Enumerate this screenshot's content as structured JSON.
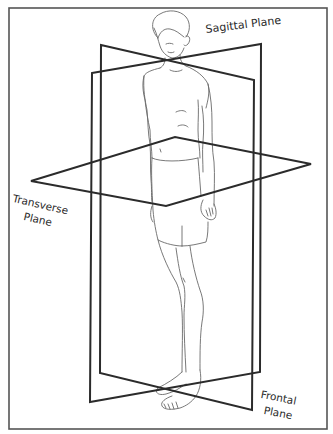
{
  "diagram": {
    "labels": {
      "sagittal": "Sagittal Plane",
      "transverse_line1": "Transverse",
      "transverse_line2": "Plane",
      "frontal_line1": "Frontal",
      "frontal_line2": "Plane"
    },
    "colors": {
      "background": "#ffffff",
      "frame": "#555555",
      "plane_stroke": "#2b2b2b",
      "figure_stroke": "#6a6a6a",
      "label_text": "#2a2a2a"
    },
    "frame": {
      "x": 9,
      "y": 8,
      "width": 318,
      "height": 421
    },
    "planes": [
      {
        "name": "sagittal-plane",
        "points": "101,45 254,80 252,410 100,373"
      },
      {
        "name": "frontal-plane",
        "points": "92,73 261,44 260,372 90,402"
      },
      {
        "name": "transverse-plane",
        "points": "31,181 175,137 311,164 166,206"
      }
    ]
  }
}
